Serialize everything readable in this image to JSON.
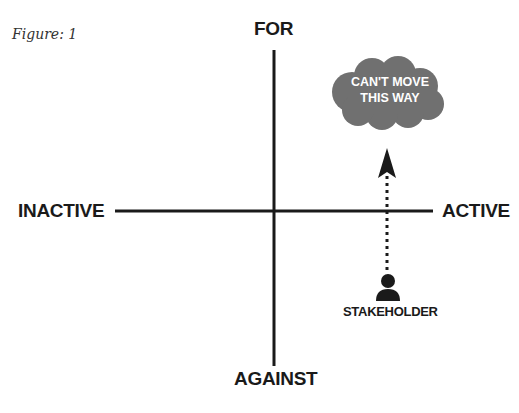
{
  "figure": {
    "caption": "Figure: 1",
    "axes": {
      "top_label": "FOR",
      "bottom_label": "AGAINST",
      "left_label": "INACTIVE",
      "right_label": "ACTIVE"
    },
    "cloud": {
      "line1": "CAN'T MOVE",
      "line2": "THIS WAY",
      "color": "#707070"
    },
    "stakeholder": {
      "label": "STAKEHOLDER",
      "icon": "person-icon"
    },
    "arrow": {
      "style": "dotted",
      "direction": "up"
    },
    "colors": {
      "ink": "#1a1a1a",
      "background": "#ffffff"
    }
  }
}
